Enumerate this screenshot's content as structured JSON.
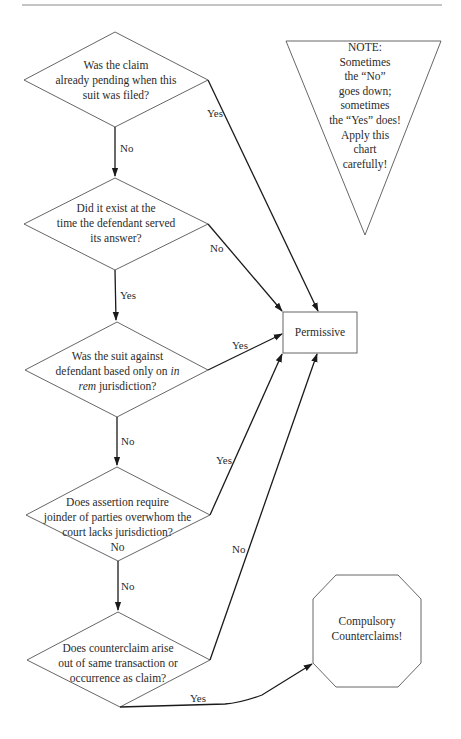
{
  "header": {
    "text": ""
  },
  "diagram": {
    "type": "flowchart",
    "decisions": [
      {
        "id": "d1",
        "lines": [
          "Was the claim",
          "already pending when this",
          "suit was filed?"
        ]
      },
      {
        "id": "d2",
        "lines": [
          "Did it exist at the",
          "time the defendant served",
          "its answer?"
        ]
      },
      {
        "id": "d3",
        "lines": [
          "Was the suit against",
          "defendant based only on",
          "jurisdiction?"
        ],
        "italic_1": "in",
        "italic_2": "rem"
      },
      {
        "id": "d4",
        "lines": [
          "Does assertion require",
          "joinder of parties overwhom the",
          "court lacks jurisdiction?"
        ],
        "inner_label": "No"
      },
      {
        "id": "d5",
        "lines": [
          "Does counterclaim arise",
          "out of same transaction or",
          "occurrence as claim?"
        ]
      }
    ],
    "outcomes": {
      "permissive": "Permissive",
      "compulsory": [
        "Compulsory",
        "Counterclaims!"
      ]
    },
    "note": {
      "lines": [
        "NOTE:",
        "Sometimes",
        "the “No”",
        "goes down;",
        "sometimes",
        "the “Yes” does!",
        "Apply this",
        "chart",
        "carefully!"
      ]
    },
    "edge_labels": {
      "d1_yes": "Yes",
      "d1_no": "No",
      "d2_no": "No",
      "d2_yes": "Yes",
      "d3_yes": "Yes",
      "d3_no": "No",
      "d4_yes": "Yes",
      "d4_no": "No",
      "d5_no": "No",
      "d5_yes": "Yes"
    },
    "edges": [
      {
        "from": "d1",
        "to": "permissive",
        "label": "Yes"
      },
      {
        "from": "d1",
        "to": "d2",
        "label": "No"
      },
      {
        "from": "d2",
        "to": "permissive",
        "label": "No"
      },
      {
        "from": "d2",
        "to": "d3",
        "label": "Yes"
      },
      {
        "from": "d3",
        "to": "permissive",
        "label": "Yes"
      },
      {
        "from": "d3",
        "to": "d4",
        "label": "No"
      },
      {
        "from": "d4",
        "to": "permissive",
        "label": "Yes"
      },
      {
        "from": "d4",
        "to": "d5",
        "label": "No"
      },
      {
        "from": "d5",
        "to": "permissive",
        "label": "No"
      },
      {
        "from": "d5",
        "to": "compulsory",
        "label": "Yes"
      }
    ],
    "colors": {
      "stroke": "#2a2a2a",
      "shape_stroke": "#555555",
      "background": "#ffffff"
    }
  }
}
